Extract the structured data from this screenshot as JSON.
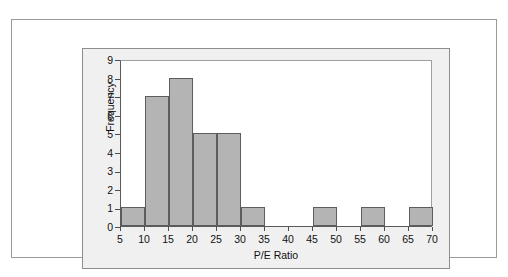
{
  "chart_data": {
    "type": "bar",
    "title": "",
    "xlabel": "P/E Ratio",
    "ylabel": "Frequency",
    "bin_width": 5,
    "bin_edges": [
      5,
      10,
      15,
      20,
      25,
      30,
      35,
      40,
      45,
      50,
      55,
      60,
      65,
      70
    ],
    "categories": [
      "5-10",
      "10-15",
      "15-20",
      "20-25",
      "25-30",
      "30-35",
      "35-40",
      "40-45",
      "45-50",
      "50-55",
      "55-60",
      "60-65",
      "65-70"
    ],
    "values": [
      1,
      7,
      8,
      5,
      5,
      1,
      0,
      0,
      1,
      0,
      1,
      0,
      1
    ],
    "xlim": [
      5,
      70
    ],
    "ylim": [
      0,
      9
    ],
    "x_ticks": [
      "5",
      "10",
      "15",
      "20",
      "25",
      "30",
      "35",
      "40",
      "45",
      "50",
      "55",
      "60",
      "65",
      "70"
    ],
    "x_tick_values": [
      5,
      10,
      15,
      20,
      25,
      30,
      35,
      40,
      45,
      50,
      55,
      60,
      65,
      70
    ],
    "y_ticks": [
      "0",
      "1",
      "2",
      "3",
      "4",
      "5",
      "6",
      "7",
      "8",
      "9"
    ],
    "y_tick_values": [
      0,
      1,
      2,
      3,
      4,
      5,
      6,
      7,
      8,
      9
    ],
    "grid": false,
    "legend": false,
    "bar_fill_color": "#b4b4b4",
    "bar_edge_color": "#5d5d5d",
    "panel_background_color": "#f0f0f0",
    "plot_background_color": "#ffffff",
    "axis_color": "#4d4d4d",
    "text_color": "#111111"
  }
}
